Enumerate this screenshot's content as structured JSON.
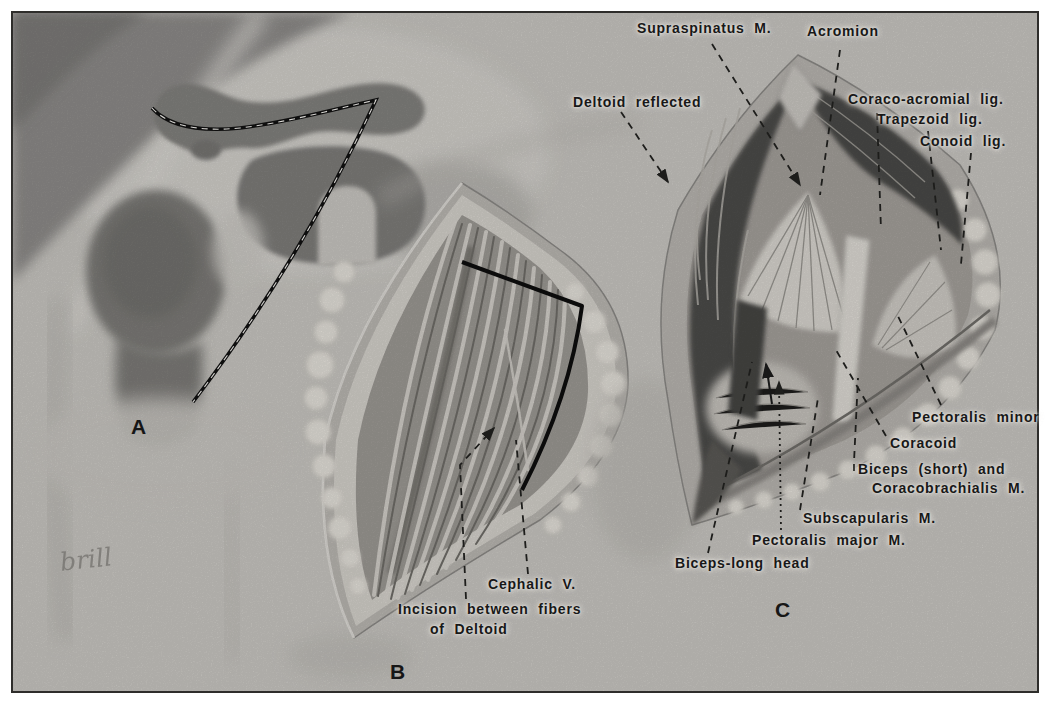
{
  "figure": {
    "type": "anatomical-diagram",
    "colors": {
      "paper": "#ffffff",
      "canvas": "#c7c5c0",
      "ink": "#181818",
      "leader": "#1d1d1b"
    },
    "panels": [
      {
        "letter": "A",
        "x": 131,
        "y": 415
      },
      {
        "letter": "B",
        "x": 390,
        "y": 660
      },
      {
        "letter": "C",
        "x": 775,
        "y": 598
      }
    ],
    "labels": [
      {
        "id": "supraspinatus-m",
        "text": "Supraspinatus M.",
        "x": 637,
        "y": 20,
        "leader": [
          [
            712,
            44
          ],
          [
            800,
            185
          ]
        ],
        "arrow": true,
        "style": "dashed"
      },
      {
        "id": "acromion",
        "text": "Acromion",
        "x": 807,
        "y": 23,
        "leader": [
          [
            840,
            50
          ],
          [
            820,
            195
          ]
        ],
        "arrow": false,
        "style": "dashed"
      },
      {
        "id": "coraco-acromial-lig",
        "text": "Coraco-acromial lig.",
        "x": 848,
        "y": 91,
        "leader": [
          [
            877,
            113
          ],
          [
            881,
            230
          ]
        ],
        "arrow": false,
        "style": "dashed"
      },
      {
        "id": "trapezoid-lig",
        "text": "Trapezoid lig.",
        "x": 877,
        "y": 111,
        "leader": [
          [
            928,
            131
          ],
          [
            941,
            250
          ]
        ],
        "arrow": false,
        "style": "dashed"
      },
      {
        "id": "conoid-lig",
        "text": "Conoid lig.",
        "x": 920,
        "y": 133,
        "leader": [
          [
            971,
            153
          ],
          [
            961,
            264
          ]
        ],
        "arrow": false,
        "style": "dashed"
      },
      {
        "id": "deltoid-reflected",
        "text": "Deltoid reflected",
        "x": 573,
        "y": 94,
        "leader": [
          [
            621,
            112
          ],
          [
            668,
            182
          ]
        ],
        "arrow": true,
        "style": "dashed"
      },
      {
        "id": "pectoralis-minor",
        "text": "Pectoralis minor",
        "x": 912,
        "y": 409,
        "leader": [
          [
            941,
            405
          ],
          [
            896,
            312
          ]
        ],
        "arrow": false,
        "style": "dashed"
      },
      {
        "id": "coracoid",
        "text": "Coracoid",
        "x": 890,
        "y": 435,
        "leader": [
          [
            886,
            436
          ],
          [
            836,
            350
          ]
        ],
        "arrow": false,
        "style": "dashed"
      },
      {
        "id": "biceps-short",
        "text": "Biceps (short) and",
        "x": 858,
        "y": 461,
        "leader": [
          [
            854,
            471
          ],
          [
            854,
            462
          ],
          [
            858,
            378
          ]
        ],
        "arrow": false,
        "style": "dashed"
      },
      {
        "id": "coracobrachialis-m",
        "text": "Coracobrachialis M.",
        "x": 872,
        "y": 480
      },
      {
        "id": "subscapularis-m",
        "text": "Subscapularis M.",
        "x": 803,
        "y": 510,
        "leader": [
          [
            800,
            510
          ],
          [
            818,
            398
          ]
        ],
        "arrow": false,
        "style": "dashed"
      },
      {
        "id": "pectoralis-major-m",
        "text": "Pectoralis major M.",
        "x": 752,
        "y": 532,
        "leader": [
          [
            781,
            530
          ],
          [
            779,
            382
          ]
        ],
        "arrow": true,
        "style": "dotted"
      },
      {
        "id": "biceps-long-head",
        "text": "Biceps-long head",
        "x": 675,
        "y": 555,
        "leader": [
          [
            708,
            553
          ],
          [
            752,
            362
          ]
        ],
        "arrow": false,
        "style": "dashed"
      },
      {
        "id": "cephalic-v",
        "text": "Cephalic V.",
        "x": 488,
        "y": 576,
        "leader": [
          [
            528,
            574
          ],
          [
            516,
            440
          ]
        ],
        "arrow": false,
        "style": "dashed"
      },
      {
        "id": "incision-line1",
        "text": "Incision between fibers",
        "x": 398,
        "y": 601,
        "leader": [
          [
            466,
            599
          ],
          [
            460,
            465
          ],
          [
            494,
            428
          ]
        ],
        "arrow": true,
        "style": "dashed"
      },
      {
        "id": "incision-line2",
        "text": "of Deltoid",
        "x": 430,
        "y": 621
      }
    ],
    "signature": "brill"
  }
}
